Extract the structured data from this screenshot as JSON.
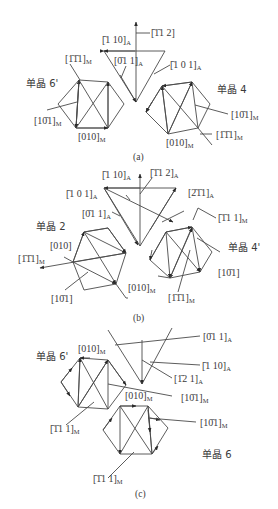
{
  "figure": {
    "panels": [
      {
        "id": "a",
        "caption": "(a)",
        "crystals": [
          "单晶 6'",
          "单晶 4"
        ],
        "labels": {
          "a1": "[̄1̄1 2]",
          "a2": "[̄1 10]",
          "a2_sub": "A",
          "a3": "[0̄1 1]",
          "a3_sub": "A",
          "a4": "[̄1 0 1]",
          "a4_sub": "A",
          "a5": "[1̄1̄1]",
          "a5_sub": "M",
          "a6": "[10̄1]",
          "a6_sub": "M",
          "a7": "[010]",
          "a7_sub": "M",
          "a8": "[10̄1]",
          "a8_sub": "M",
          "a9": "[010]",
          "a9_sub": "M",
          "a10": "[1̄1̄1]",
          "a10_sub": "M"
        }
      },
      {
        "id": "b",
        "caption": "(b)",
        "crystals": [
          "单晶 2",
          "单晶 4'"
        ],
        "labels": {
          "b1": "[̄1 10]",
          "b1_sub": "A",
          "b2": "[̄1̄1 2]",
          "b2_sub": "A",
          "b3": "[̄1 0 1]",
          "b3_sub": "A",
          "b4": "[0̄1 1]",
          "b4_sub": "A",
          "b5": "[2̄1̄1]",
          "b5_sub": "A",
          "b6": "[̄1̄1 1]",
          "b6_sub": "M",
          "b7": "[010]",
          "b8": "[1̄1̄1]",
          "b8_sub": "M",
          "b9": "[10̄1]",
          "b10": "[010]",
          "b10_sub": "M",
          "b11": "[10̄1]",
          "b12": "[1̄1̄1]",
          "b12_sub": "M"
        }
      },
      {
        "id": "c",
        "caption": "(c)",
        "crystals": [
          "单晶 6'",
          "单晶 6"
        ],
        "labels": {
          "c1": "[0̄1 1]",
          "c1_sub": "A",
          "c2": "[010]",
          "c2_sub": "M",
          "c3": "[̄1 10]",
          "c3_sub": "A",
          "c4": "[1̄2 1]",
          "c4_sub": "A",
          "c5": "[010]",
          "c5_sub": "M",
          "c6": "[10̄1]",
          "c6_sub": "M",
          "c7": "[̄1̄1 1]",
          "c7_sub": "M",
          "c8": "[10̄1]",
          "c8_sub": "M",
          "c9": "[̄1̄1 1]",
          "c9_sub": "M"
        }
      }
    ]
  }
}
